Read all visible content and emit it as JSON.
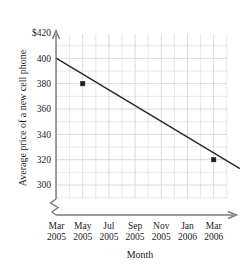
{
  "chart_data": {
    "type": "line",
    "title": "",
    "xlabel": "Month",
    "ylabel": "Average price of a new cell phone",
    "x_tick_labels": [
      {
        "line1": "Mar",
        "line2": "2005"
      },
      {
        "line1": "May",
        "line2": "2005"
      },
      {
        "line1": "Jul",
        "line2": "2005"
      },
      {
        "line1": "Sep",
        "line2": "2005"
      },
      {
        "line1": "Nov",
        "line2": "2005"
      },
      {
        "line1": "Jan",
        "line2": "2006"
      },
      {
        "line1": "Mar",
        "line2": "2006"
      }
    ],
    "y_tick_labels": [
      "$420",
      "400",
      "380",
      "360",
      "340",
      "320",
      "300"
    ],
    "y_tick_values": [
      420,
      400,
      380,
      360,
      340,
      320,
      300
    ],
    "ylim": [
      300,
      420
    ],
    "y_axis_break": true,
    "grid": true,
    "grid_minor_step_x_months": 1,
    "grid_major_step_x_months": 2,
    "grid_minor_step_y": 10,
    "legend": "none",
    "categories": [
      "Mar 2005",
      "May 2005",
      "Jul 2005",
      "Sep 2005",
      "Nov 2005",
      "Jan 2006",
      "Mar 2006"
    ],
    "values": [
      400,
      380,
      367,
      353,
      340,
      327,
      320
    ],
    "marked_points": [
      {
        "x": "May 2005",
        "y": 380
      },
      {
        "x": "Mar 2006",
        "y": 320
      }
    ],
    "line_endpoints": [
      {
        "x": "Mar 2005",
        "y": 400
      },
      {
        "x": "May 2006",
        "y": 313
      }
    ],
    "colors": {
      "line": "#2b2b2b",
      "marker": "#1c1c1c",
      "grid_minor": "#dedede",
      "grid_major": "#cfcfcf",
      "axis": "#7a7a7a",
      "background": "#ffffff",
      "text": "#1a1a1a"
    }
  }
}
